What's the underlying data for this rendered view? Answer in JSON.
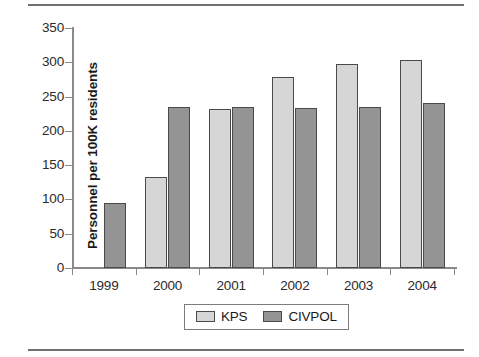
{
  "chart_data": {
    "type": "bar",
    "title": "",
    "subtitle": "",
    "xlabel": "",
    "ylabel": "Personnel per 100K residents",
    "categories": [
      "1999",
      "2000",
      "2001",
      "2002",
      "2003",
      "2004"
    ],
    "series": [
      {
        "name": "KPS",
        "values": [
          0,
          133,
          232,
          278,
          297,
          304
        ],
        "color": "#d6d6d6"
      },
      {
        "name": "CIVPOL",
        "values": [
          95,
          235,
          235,
          234,
          235,
          241
        ],
        "color": "#949494"
      }
    ],
    "ylim": [
      0,
      350
    ],
    "yticks": [
      0,
      50,
      100,
      150,
      200,
      250,
      300,
      350
    ],
    "ytick_labels": [
      "0",
      "50",
      "100",
      "150",
      "200",
      "250",
      "300",
      "350"
    ],
    "grid": false,
    "legend_position": "bottom-center",
    "legend_entries": [
      "KPS",
      "CIVPOL"
    ],
    "annotations": []
  },
  "figure": {
    "has_top_rule": true,
    "has_bottom_rule": true,
    "background": "#ffffff",
    "axis_color": "#8a8a8a",
    "bar_outline_color": "#4a4a4a"
  }
}
